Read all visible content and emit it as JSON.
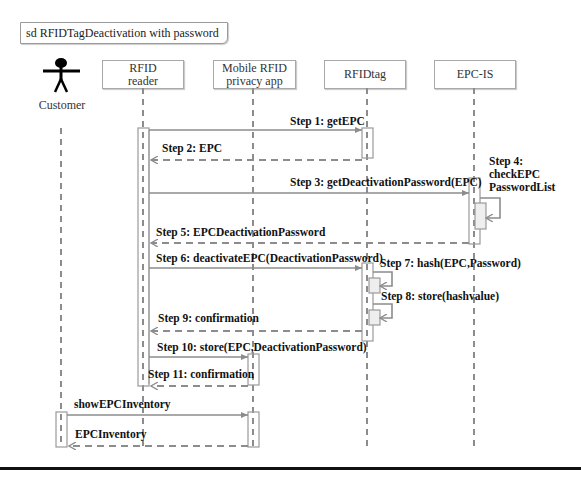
{
  "frame": {
    "title": "sd RFIDTagDeactivation with password"
  },
  "actor": {
    "label": "Customer",
    "icon": "stick-figure-icon"
  },
  "participants": [
    {
      "id": "rfid-reader",
      "line1": "RFID",
      "line2": "reader"
    },
    {
      "id": "mobile-app",
      "line1": "Mobile RFID",
      "line2": "privacy app"
    },
    {
      "id": "rfid-tag",
      "line1": "RFIDtag",
      "line2": ""
    },
    {
      "id": "epc-is",
      "line1": "EPC-IS",
      "line2": ""
    }
  ],
  "messages": {
    "step1": "Step 1: getEPC",
    "step2": "Step 2: EPC",
    "step3": "Step 3: getDeactivationPassword(EPC)",
    "step4_l1": "Step 4:",
    "step4_l2": "checkEPC",
    "step4_l3": "PasswordList",
    "step5": "Step 5: EPCDeactivationPassword",
    "step6": "Step 6: deactivateEPC(DeactivationPassword)",
    "step7": "Step 7: hash(EPC,Password)",
    "step8": "Step 8: store(hashvalue)",
    "step9": "Step 9: confirmation",
    "step10": "Step 10: store(EPC,DeactivationPassword)",
    "step11": "Step 11: confirmation",
    "show": "showEPCInventory",
    "inventory": "EPCInventory"
  },
  "colors": {
    "line": "#8c8c8c",
    "text": "#111111",
    "activation_fill": "#eeeeee"
  }
}
